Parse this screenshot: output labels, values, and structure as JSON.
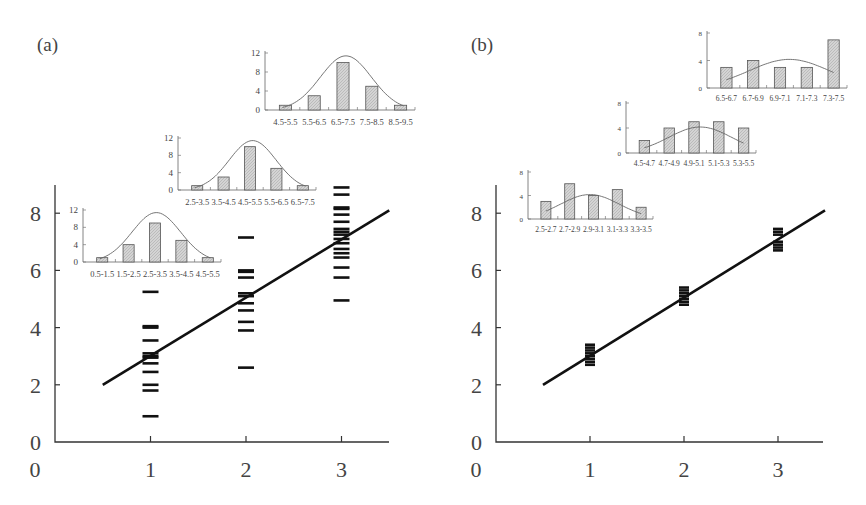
{
  "panels": [
    {
      "label": "(a)",
      "main": {
        "x_ticks": [
          "0",
          "1",
          "2",
          "3"
        ],
        "y_ticks": [
          "0",
          "2",
          "4",
          "6",
          "8"
        ],
        "fit_line": {
          "x1": 0.5,
          "y1": 2.0,
          "x2": 3.5,
          "y2": 8.1
        },
        "groups": [
          {
            "x": 1,
            "values": [
              5.25,
              4.05,
              4.0,
              3.55,
              3.1,
              3.0,
              2.95,
              2.75,
              2.45,
              2.0,
              1.8,
              0.9
            ]
          },
          {
            "x": 2,
            "values": [
              7.15,
              6.0,
              5.95,
              5.75,
              5.2,
              5.1,
              4.85,
              4.6,
              4.2,
              3.9,
              2.6
            ]
          },
          {
            "x": 3,
            "values": [
              8.9,
              8.65,
              8.2,
              8.15,
              7.95,
              7.7,
              7.45,
              7.35,
              7.25,
              7.1,
              6.95,
              6.75,
              6.6,
              6.45,
              6.1,
              5.75,
              4.95
            ]
          }
        ]
      },
      "insets": [
        {
          "categories": [
            "0.5-1.5",
            "1.5-2.5",
            "2.5-3.5",
            "3.5-4.5",
            "4.5-5.5"
          ],
          "values": [
            1,
            4,
            9,
            5,
            1
          ],
          "y_ticks": [
            "0",
            "4",
            "8",
            "12"
          ],
          "ymax": 12
        },
        {
          "categories": [
            "2.5-3.5",
            "3.5-4.5",
            "4.5-5.5",
            "5.5-6.5",
            "6.5-7.5"
          ],
          "values": [
            1,
            3,
            10,
            5,
            1
          ],
          "y_ticks": [
            "0",
            "4",
            "8",
            "12"
          ],
          "ymax": 12
        },
        {
          "categories": [
            "4.5-5.5",
            "5.5-6.5",
            "6.5-7.5",
            "7.5-8.5",
            "8.5-9.5"
          ],
          "values": [
            1,
            3,
            10,
            5,
            1
          ],
          "y_ticks": [
            "0",
            "4",
            "8",
            "12"
          ],
          "ymax": 12
        }
      ]
    },
    {
      "label": "(b)",
      "main": {
        "x_ticks": [
          "0",
          "1",
          "2",
          "3"
        ],
        "y_ticks": [
          "0",
          "2",
          "4",
          "6",
          "8"
        ],
        "fit_line": {
          "x1": 0.5,
          "y1": 2.0,
          "x2": 3.5,
          "y2": 8.1
        },
        "groups": [
          {
            "x": 1,
            "values": [
              3.4,
              3.3,
              3.2,
              3.1,
              3.0,
              2.9,
              2.8,
              2.7
            ]
          },
          {
            "x": 2,
            "values": [
              5.4,
              5.3,
              5.2,
              5.1,
              5.0,
              4.9,
              4.8
            ]
          },
          {
            "x": 3,
            "values": [
              7.45,
              7.35,
              7.25,
              7.0,
              6.9,
              6.8,
              6.7
            ]
          }
        ]
      },
      "insets": [
        {
          "categories": [
            "2.5-2.7",
            "2.7-2.9",
            "2.9-3.1",
            "3.1-3.3",
            "3.3-3.5"
          ],
          "values": [
            3,
            6,
            4,
            5,
            2
          ],
          "y_ticks": [
            "0",
            "4",
            "8"
          ],
          "ymax": 8
        },
        {
          "categories": [
            "4.5-4.7",
            "4.7-4.9",
            "4.9-5.1",
            "5.1-5.3",
            "5.3-5.5"
          ],
          "values": [
            2,
            4,
            5,
            5,
            4
          ],
          "y_ticks": [
            "0",
            "4",
            "8"
          ],
          "ymax": 8
        },
        {
          "categories": [
            "6.5-6.7",
            "6.7-6.9",
            "6.9-7.1",
            "7.1-7.3",
            "7.3-7.5"
          ],
          "values": [
            3,
            4,
            3,
            3,
            7
          ],
          "y_ticks": [
            "0",
            "4",
            "8"
          ],
          "ymax": 8
        }
      ]
    }
  ],
  "chart_data": [
    {
      "type": "scatter",
      "title": "(a)",
      "xlabel": "",
      "ylabel": "",
      "xlim": [
        0,
        3.5
      ],
      "ylim": [
        0,
        9
      ],
      "x_ticks": [
        0,
        1,
        2,
        3
      ],
      "y_ticks": [
        0,
        2,
        4,
        6,
        8
      ],
      "series": [
        {
          "name": "x=1",
          "x": 1,
          "values": [
            5.25,
            4.05,
            4.0,
            3.55,
            3.1,
            3.0,
            2.95,
            2.75,
            2.45,
            2.0,
            1.8,
            0.9
          ]
        },
        {
          "name": "x=2",
          "x": 2,
          "values": [
            7.15,
            6.0,
            5.95,
            5.75,
            5.2,
            5.1,
            4.85,
            4.6,
            4.2,
            3.9,
            2.6
          ]
        },
        {
          "name": "x=3",
          "x": 3,
          "values": [
            8.9,
            8.65,
            8.2,
            8.15,
            7.95,
            7.7,
            7.45,
            7.35,
            7.25,
            7.1,
            6.95,
            6.75,
            6.6,
            6.45,
            6.1,
            5.75,
            4.95
          ]
        }
      ],
      "fit_line": {
        "slope": 2,
        "intercept": 1,
        "x_range": [
          0.5,
          3.5
        ]
      },
      "insets": [
        {
          "type": "bar",
          "categories": [
            "0.5-1.5",
            "1.5-2.5",
            "2.5-3.5",
            "3.5-4.5",
            "4.5-5.5"
          ],
          "values": [
            1,
            4,
            9,
            5,
            1
          ],
          "ylim": [
            0,
            12
          ],
          "overlay": "normal curve"
        },
        {
          "type": "bar",
          "categories": [
            "2.5-3.5",
            "3.5-4.5",
            "4.5-5.5",
            "5.5-6.5",
            "6.5-7.5"
          ],
          "values": [
            1,
            3,
            10,
            5,
            1
          ],
          "ylim": [
            0,
            12
          ],
          "overlay": "normal curve"
        },
        {
          "type": "bar",
          "categories": [
            "4.5-5.5",
            "5.5-6.5",
            "6.5-7.5",
            "7.5-8.5",
            "8.5-9.5"
          ],
          "values": [
            1,
            3,
            10,
            5,
            1
          ],
          "ylim": [
            0,
            12
          ],
          "overlay": "normal curve"
        }
      ]
    },
    {
      "type": "scatter",
      "title": "(b)",
      "xlabel": "",
      "ylabel": "",
      "xlim": [
        0,
        3.5
      ],
      "ylim": [
        0,
        9
      ],
      "x_ticks": [
        0,
        1,
        2,
        3
      ],
      "y_ticks": [
        0,
        2,
        4,
        6,
        8
      ],
      "series": [
        {
          "name": "x=1",
          "x": 1,
          "values": [
            3.4,
            3.3,
            3.2,
            3.1,
            3.0,
            2.9,
            2.8,
            2.7
          ]
        },
        {
          "name": "x=2",
          "x": 2,
          "values": [
            5.4,
            5.3,
            5.2,
            5.1,
            5.0,
            4.9,
            4.8
          ]
        },
        {
          "name": "x=3",
          "x": 3,
          "values": [
            7.45,
            7.35,
            7.25,
            7.0,
            6.9,
            6.8,
            6.7
          ]
        }
      ],
      "fit_line": {
        "slope": 2,
        "intercept": 1,
        "x_range": [
          0.5,
          3.5
        ]
      },
      "insets": [
        {
          "type": "bar",
          "categories": [
            "2.5-2.7",
            "2.7-2.9",
            "2.9-3.1",
            "3.1-3.3",
            "3.3-3.5"
          ],
          "values": [
            3,
            6,
            4,
            5,
            2
          ],
          "ylim": [
            0,
            8
          ],
          "overlay": "normal curve"
        },
        {
          "type": "bar",
          "categories": [
            "4.5-4.7",
            "4.7-4.9",
            "4.9-5.1",
            "5.1-5.3",
            "5.3-5.5"
          ],
          "values": [
            2,
            4,
            5,
            5,
            4
          ],
          "ylim": [
            0,
            8
          ],
          "overlay": "normal curve"
        },
        {
          "type": "bar",
          "categories": [
            "6.5-6.7",
            "6.7-6.9",
            "6.9-7.1",
            "7.1-7.3",
            "7.3-7.5"
          ],
          "values": [
            3,
            4,
            3,
            3,
            7
          ],
          "ylim": [
            0,
            8
          ],
          "overlay": "normal curve"
        }
      ]
    }
  ]
}
